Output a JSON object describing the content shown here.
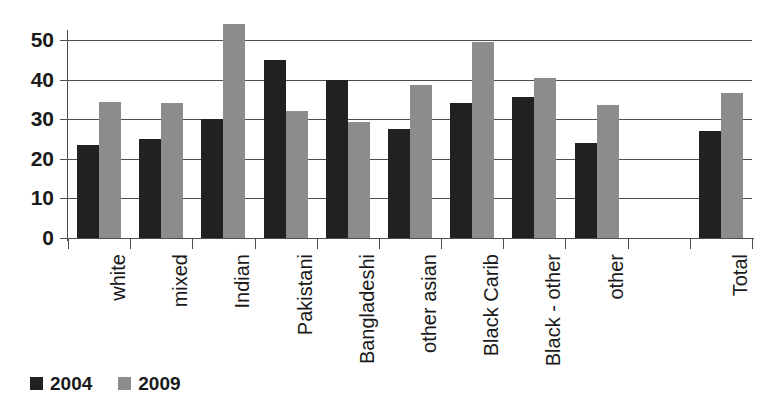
{
  "chart_data": {
    "type": "bar",
    "title": "",
    "subtitle": "",
    "xlabel": "",
    "ylabel": "",
    "ylim": [
      0,
      50
    ],
    "yticks": [
      0,
      10,
      20,
      30,
      40,
      50
    ],
    "ytick_labels": [
      "0",
      "10",
      "20",
      "30",
      "40",
      "50"
    ],
    "grid": true,
    "legend_position": "bottom-left",
    "categories": [
      "white",
      "mixed",
      "Indian",
      "Pakistani",
      "Bangladeshi",
      "other asian",
      "Black Carib",
      "Black - other",
      "other",
      "",
      "Total"
    ],
    "series": [
      {
        "name": "2004",
        "color": "#212121",
        "values": [
          23.5,
          25.0,
          30.0,
          45.0,
          40.0,
          27.5,
          34.0,
          35.5,
          24.0,
          null,
          27.0
        ]
      },
      {
        "name": "2009",
        "color": "#8c8c8c",
        "values": [
          34.3,
          34.0,
          54.0,
          32.0,
          29.4,
          38.6,
          49.4,
          40.5,
          33.5,
          null,
          36.5
        ]
      }
    ]
  },
  "legend": {
    "items": [
      {
        "label": "2004",
        "color": "#212121"
      },
      {
        "label": "2009",
        "color": "#8c8c8c"
      }
    ]
  },
  "colors": {
    "series_2004": "#212121",
    "series_2009": "#8c8c8c",
    "axis": "#4d4d4d",
    "grid": "#4d4d4d",
    "text": "#1a1a1a",
    "background": "#ffffff"
  }
}
